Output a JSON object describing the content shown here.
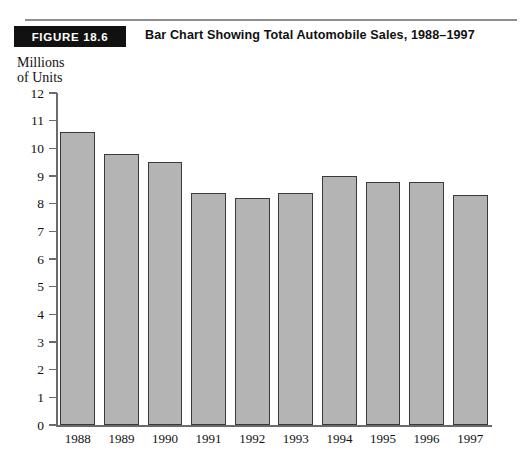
{
  "figure": {
    "badge_label": "FIGURE 18.6",
    "title": "Bar Chart Showing Total Automobile Sales, 1988–1997"
  },
  "axis_caption": {
    "line1": "Millions",
    "line2": "of Units"
  },
  "chart_data": {
    "type": "bar",
    "title": "Bar Chart Showing Total Automobile Sales, 1988–1997",
    "xlabel": "",
    "ylabel": "Millions of Units",
    "categories": [
      "1988",
      "1989",
      "1990",
      "1991",
      "1992",
      "1993",
      "1994",
      "1995",
      "1996",
      "1997"
    ],
    "values": [
      10.6,
      9.8,
      9.5,
      8.4,
      8.2,
      8.4,
      9.0,
      8.8,
      8.8,
      8.3
    ],
    "ylim": [
      0,
      12
    ],
    "ytick_labels": [
      "0",
      "1",
      "2",
      "3",
      "4",
      "5",
      "6",
      "7",
      "8",
      "9",
      "10",
      "11",
      "12"
    ],
    "ytick_values": [
      0,
      1,
      2,
      3,
      4,
      5,
      6,
      7,
      8,
      9,
      10,
      11,
      12
    ],
    "grid": false,
    "legend": null,
    "bar_fill_color": "#b4b4b4",
    "bar_edge_color": "#3a3a3a",
    "axis_color": "#6b6b6b"
  }
}
